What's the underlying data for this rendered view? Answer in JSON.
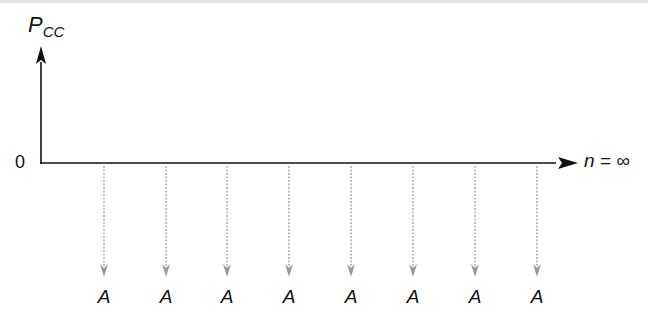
{
  "diagram": {
    "type": "cash-flow-diagram",
    "y_axis_label": "P",
    "y_axis_label_sub": "CC",
    "origin_label": "0",
    "x_axis_end_label": "n = ∞",
    "arrow_label": "A",
    "arrows": [
      {
        "x": 104,
        "label": "A"
      },
      {
        "x": 166,
        "label": "A"
      },
      {
        "x": 227,
        "label": "A"
      },
      {
        "x": 289,
        "label": "A"
      },
      {
        "x": 351,
        "label": "A"
      },
      {
        "x": 413,
        "label": "A"
      },
      {
        "x": 475,
        "label": "A"
      },
      {
        "x": 537,
        "label": "A"
      }
    ],
    "colors": {
      "axis": "#111111",
      "cash_flow_arrow": "#9a9a9a"
    }
  },
  "chart_data": {
    "type": "cash-flow",
    "title": "",
    "ylabel": "P_CC",
    "xlabel": "n = ∞",
    "origin": "0",
    "periods": [
      1,
      2,
      3,
      4,
      5,
      6,
      7,
      8
    ],
    "values": [
      "-A",
      "-A",
      "-A",
      "-A",
      "-A",
      "-A",
      "-A",
      "-A"
    ],
    "direction": "downward (outflows)",
    "continues_to_infinity": true
  }
}
